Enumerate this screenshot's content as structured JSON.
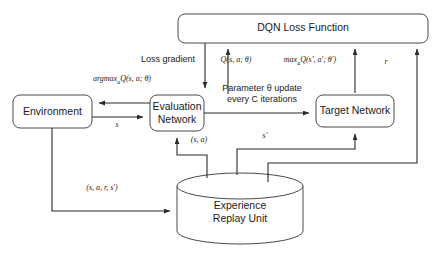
{
  "diagram": {
    "stroke_color": "#2b2b2b",
    "fill_color": "#ffffff",
    "nodes": [
      {
        "id": "dqn_loss",
        "label": "DQN Loss Function",
        "shape": "rounded-rect"
      },
      {
        "id": "environment",
        "label": "Environment",
        "shape": "rounded-rect"
      },
      {
        "id": "eval_net",
        "label": "Evaluation\nNetwork",
        "shape": "rounded-rect"
      },
      {
        "id": "target_net",
        "label": "Target Network",
        "shape": "rounded-rect"
      },
      {
        "id": "replay",
        "label": "Experience\nReplay Unit",
        "shape": "cylinder"
      }
    ],
    "edge_labels": [
      {
        "id": "loss_gradient",
        "text": "Loss gradient",
        "style": "plain"
      },
      {
        "id": "q_s_a_theta",
        "text": "Q(s, a; θ)",
        "style": "math"
      },
      {
        "id": "max_q_target",
        "text": "max",
        "sub": "a",
        "text_after": "Q(s′, a′; θ′)",
        "style": "math"
      },
      {
        "id": "reward",
        "text": "r",
        "style": "math"
      },
      {
        "id": "argmax_q",
        "text": "argmax",
        "sub": "a",
        "text_after": "Q(s, a; θ)",
        "style": "math"
      },
      {
        "id": "param_update",
        "text": "Parameter θ update\nevery C iterations",
        "style": "plain"
      },
      {
        "id": "state_s",
        "text": "s",
        "style": "math"
      },
      {
        "id": "state_action",
        "text": "(s, a)",
        "style": "math"
      },
      {
        "id": "next_state",
        "text": "s′",
        "style": "math"
      },
      {
        "id": "transition",
        "text": "(s, a, r, s′)",
        "style": "math"
      }
    ]
  }
}
